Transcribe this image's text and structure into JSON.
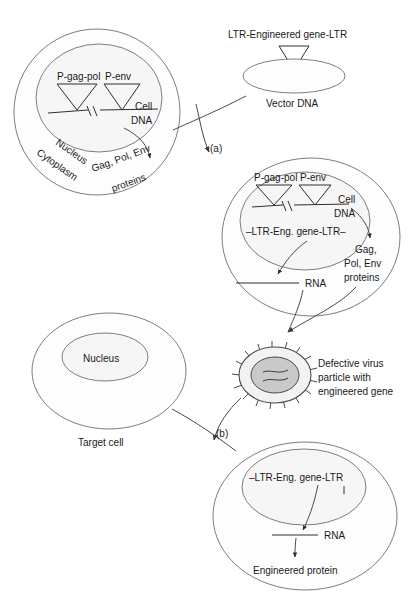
{
  "figure": {
    "type": "biology-process-diagram"
  },
  "packaging_cell": {
    "promoter_gag_pol": "P-gag-pol",
    "promoter_env": "P-env",
    "cell_dna_line1": "Cell",
    "cell_dna_line2": "DNA",
    "nucleus_label": "Nucleus",
    "cytoplasm_label": "Cytoplasm",
    "protein_label": "Gag, Pol, Env\nproteins",
    "protein_label_line1": "Gag, Pol, Env",
    "protein_label_line2": "proteins"
  },
  "vector": {
    "construct_label": "LTR-Engineered gene-LTR",
    "vector_dna_label": "Vector DNA"
  },
  "steps": {
    "step_a": "(a)",
    "step_b": "(b)"
  },
  "producer_cell": {
    "promoter_gag_pol": "P-gag-pol",
    "promoter_env": "P-env",
    "cell_dna_line1": "Cell",
    "cell_dna_line2": "DNA",
    "integrated_vector": "–LTR-Eng. gene-LTR–",
    "rna_label": "RNA",
    "proteins_line1": "Gag,",
    "proteins_line2": "Pol, Env",
    "proteins_line3": "proteins"
  },
  "virus_particle": {
    "caption_line1": "Defective virus",
    "caption_line2": "particle with",
    "caption_line3": "engineered gene"
  },
  "target_cell": {
    "nucleus_label": "Nucleus",
    "cell_label": "Target cell"
  },
  "transduced_cell": {
    "integrated_vector": "–LTR-Eng. gene-LTR",
    "rna_label": "RNA",
    "protein_label": "Engineered protein"
  },
  "colors": {
    "stroke": "#6e6e6e",
    "stroke_dark": "#3a3a3a",
    "text": "#1a1a1a",
    "nucleus_fill": "#f6f6f6",
    "virus_core": "#c9c9c9",
    "background": "#ffffff"
  }
}
